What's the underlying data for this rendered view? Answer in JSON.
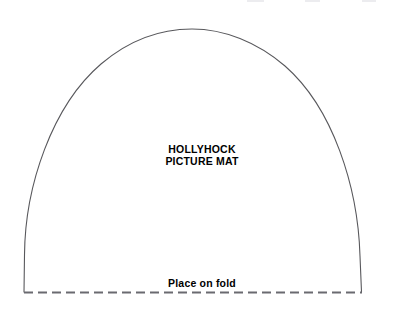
{
  "canvas": {
    "width": 404,
    "height": 322,
    "background_color": "#ffffff"
  },
  "pattern": {
    "title_lines": [
      "HOLLYHOCK",
      "PICTURE MAT"
    ],
    "fold_instruction": "Place on fold",
    "outline": {
      "stroke_color": "#58585c",
      "stroke_width": 1,
      "shape": "arch",
      "apex": {
        "x": 192,
        "y": 29
      },
      "left_base": {
        "x": 24,
        "y": 292
      },
      "right_base": {
        "x": 362,
        "y": 292
      },
      "path": "M 24 292 L 24.5 255 C 25 186 52 106 101 64 C 128 41 160 29 192 29 C 224 29 257 42 285 66 C 333 108 358 187 360 256 L 361.5 292"
    },
    "fold_line": {
      "style": "dashed",
      "stroke_color": "#6a6a70",
      "stroke_width": 2,
      "dash_length": 9,
      "gap_length": 5,
      "y": 292,
      "x_start": 24,
      "x_end": 362
    },
    "text_color": "#000000"
  },
  "artifacts": [
    {
      "x": 247,
      "width": 17
    },
    {
      "x": 305,
      "width": 15
    },
    {
      "x": 362,
      "width": 14
    }
  ]
}
